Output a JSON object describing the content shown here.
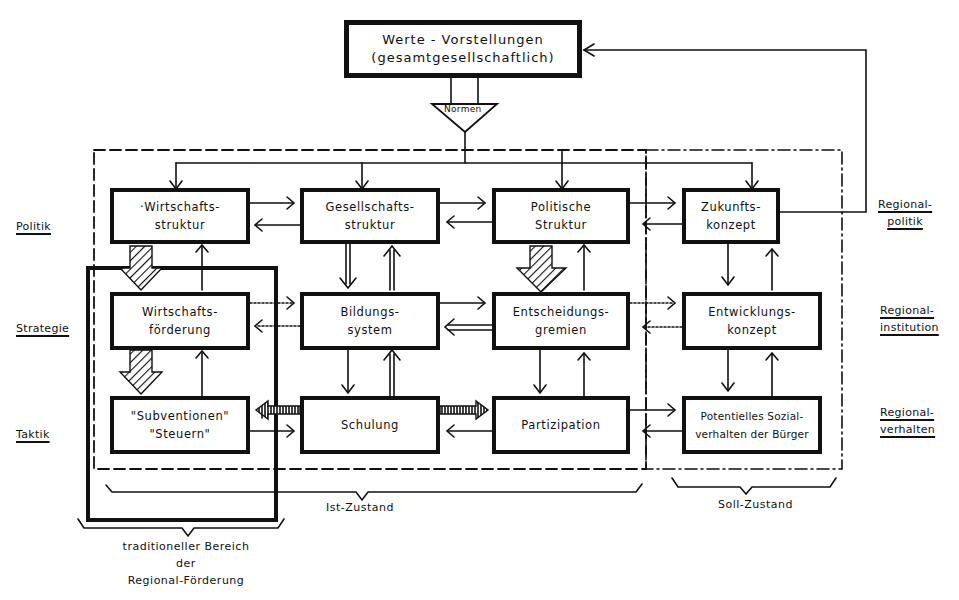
{
  "diagram": {
    "top_box": {
      "line1": "Werte - Vorstellungen",
      "line2": "(gesamtgesellschaftlich)"
    },
    "funnel_label": "Normen",
    "rows": [
      {
        "label": "Politik",
        "right_label_1": "Regional-",
        "right_label_2": "politik"
      },
      {
        "label": "Strategie",
        "right_label_1": "Regional-",
        "right_label_2": "institution"
      },
      {
        "label": "Taktik",
        "right_label_1": "Regional-",
        "right_label_2": "verhalten"
      }
    ],
    "boxes": {
      "wirtschaftsstruktur": {
        "line1": "·Wirtschafts-",
        "line2": "struktur"
      },
      "gesellschaftsstruktur": {
        "line1": "Gesellschafts-",
        "line2": "struktur"
      },
      "politische_struktur": {
        "line1": "Politische",
        "line2": "Struktur"
      },
      "zukunftskonzept": {
        "line1": "Zukunfts-",
        "line2": "konzept"
      },
      "wirtschaftsfoerderung": {
        "line1": "Wirtschafts-",
        "line2": "förderung"
      },
      "bildungssystem": {
        "line1": "Bildungs-",
        "line2": "system"
      },
      "entscheidungsgremien": {
        "line1": "Entscheidungs-",
        "line2": "gremien"
      },
      "entwicklungskonzept": {
        "line1": "Entwicklungs-",
        "line2": "konzept"
      },
      "subventionen": {
        "line1": "\"Subventionen\"",
        "line2": "\"Steuern\""
      },
      "schulung": {
        "line1": "Schulung",
        "line2": ""
      },
      "partizipation": {
        "line1": "Partizipation",
        "line2": ""
      },
      "sozialverhalten": {
        "line1": "Potentielles Sozial-",
        "line2": "verhalten der Bürger"
      }
    },
    "brackets": {
      "ist": "Ist-Zustand",
      "soll": "Soll-Zustand",
      "traditional_1": "traditioneller Bereich",
      "traditional_2": "der",
      "traditional_3": "Regional-Förderung"
    },
    "colors": {
      "ink": "#111111",
      "paper": "#ffffff"
    }
  }
}
